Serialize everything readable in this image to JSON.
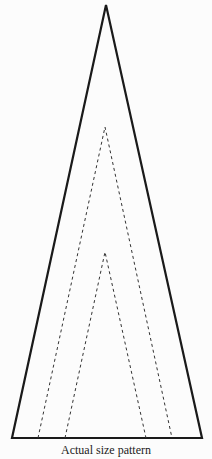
{
  "caption": "Actual size pattern",
  "colors": {
    "stroke": "#1a1a1a",
    "background": "#fcfcfc"
  },
  "shapes": {
    "outer_triangle": {
      "apex": [
        106,
        5
      ],
      "base_left": [
        12,
        438
      ],
      "base_right": [
        202,
        438
      ],
      "style": "solid"
    },
    "outer_dashed": {
      "apex": [
        105,
        127
      ],
      "base_left": [
        38,
        438
      ],
      "base_right": [
        172,
        438
      ],
      "style": "dashed"
    },
    "inner_dashed": {
      "apex": [
        105,
        252
      ],
      "base_left": [
        65,
        438
      ],
      "base_right": [
        146,
        438
      ],
      "style": "dashed"
    }
  }
}
